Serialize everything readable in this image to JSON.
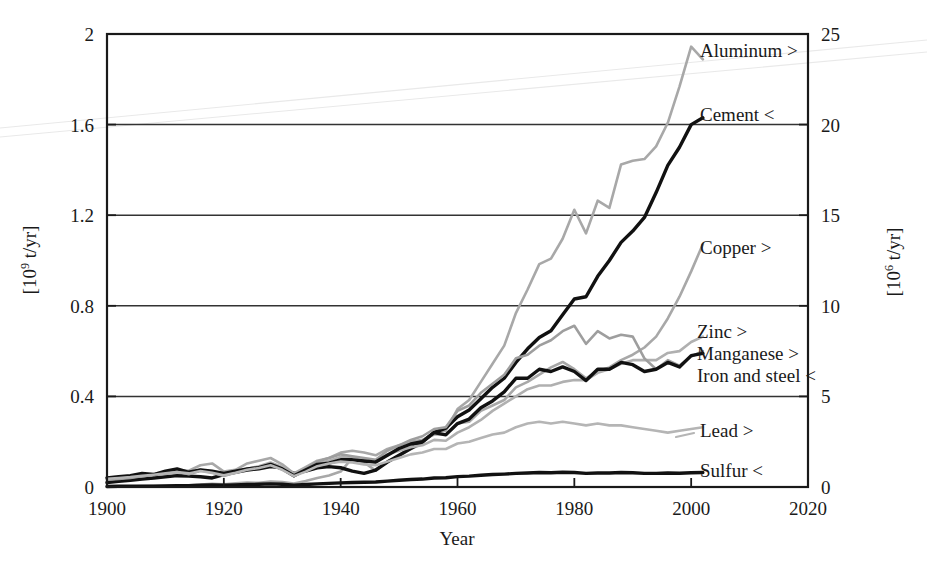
{
  "chart_data": {
    "type": "line",
    "title": "",
    "xlabel": "Year",
    "ylabel_left": "[10⁹ t/yr]",
    "ylabel_left_base": "[10",
    "ylabel_left_exp": "9",
    "ylabel_left_tail": " t/yr]",
    "ylabel_right": "[10⁶ t/yr]",
    "ylabel_right_base": "[10",
    "ylabel_right_exp": "6",
    "ylabel_right_tail": " t/yr]",
    "xlim": [
      1900,
      2020
    ],
    "ylim_left": [
      0,
      2
    ],
    "ylim_right": [
      0,
      25
    ],
    "xticks": [
      1900,
      1920,
      1940,
      1960,
      1980,
      2000,
      2020
    ],
    "xtick_labels": [
      "1900",
      "1920",
      "1940",
      "1960",
      "1980",
      "2000",
      "2020"
    ],
    "yticks_left": [
      0,
      0.4,
      0.8,
      1.2,
      1.6,
      2
    ],
    "ytick_labels_left": [
      "0",
      "0.4",
      "0.8",
      "1.2",
      "1.6",
      "2"
    ],
    "yticks_right": [
      0,
      5,
      10,
      15,
      20,
      25
    ],
    "ytick_labels_right": [
      "0",
      "5",
      "10",
      "15",
      "20",
      "25"
    ],
    "grid": true,
    "grid_axis": "y",
    "legend_position": "inline-right-annotations",
    "axis_note": "< = read on left axis (10^9 t/yr); > = read on right axis (10^6 t/yr)",
    "x": [
      1900,
      1902,
      1904,
      1906,
      1908,
      1910,
      1912,
      1914,
      1916,
      1918,
      1920,
      1922,
      1924,
      1926,
      1928,
      1930,
      1932,
      1934,
      1936,
      1938,
      1940,
      1942,
      1944,
      1946,
      1948,
      1950,
      1952,
      1954,
      1956,
      1958,
      1960,
      1962,
      1964,
      1966,
      1968,
      1970,
      1972,
      1974,
      1976,
      1978,
      1980,
      1982,
      1984,
      1986,
      1988,
      1990,
      1992,
      1994,
      1996,
      1998,
      2000,
      2002
    ],
    "series": [
      {
        "name": "Aluminum",
        "label": "Aluminum >",
        "axis": "right",
        "color": "#a8a8a8",
        "stroke_width": 2.6,
        "units": "10^6 t/yr",
        "values": [
          0.01,
          0.02,
          0.03,
          0.05,
          0.06,
          0.07,
          0.09,
          0.1,
          0.13,
          0.18,
          0.15,
          0.2,
          0.25,
          0.23,
          0.3,
          0.27,
          0.19,
          0.33,
          0.5,
          0.63,
          0.85,
          1.6,
          1.35,
          0.9,
          1.4,
          1.7,
          2.1,
          2.4,
          3.1,
          3.1,
          4.3,
          4.8,
          5.8,
          6.8,
          7.8,
          9.6,
          10.9,
          12.3,
          12.6,
          13.7,
          15.3,
          14.0,
          15.8,
          15.4,
          17.8,
          18.0,
          18.1,
          18.8,
          20.1,
          22.1,
          24.3,
          23.6
        ]
      },
      {
        "name": "Cement",
        "label": "Cement <",
        "axis": "left",
        "color": "#111111",
        "stroke_width": 3.4,
        "units": "10^9 t/yr",
        "values": [
          0.02,
          0.025,
          0.03,
          0.035,
          0.04,
          0.045,
          0.05,
          0.048,
          0.045,
          0.04,
          0.055,
          0.065,
          0.075,
          0.08,
          0.09,
          0.085,
          0.06,
          0.07,
          0.085,
          0.09,
          0.085,
          0.07,
          0.06,
          0.075,
          0.11,
          0.14,
          0.17,
          0.2,
          0.24,
          0.26,
          0.31,
          0.34,
          0.39,
          0.44,
          0.48,
          0.55,
          0.61,
          0.66,
          0.69,
          0.76,
          0.83,
          0.84,
          0.93,
          1.0,
          1.08,
          1.13,
          1.19,
          1.3,
          1.42,
          1.5,
          1.6,
          1.63
        ]
      },
      {
        "name": "Copper",
        "label": "Copper >",
        "axis": "right",
        "color": "#a8a8a8",
        "stroke_width": 2.6,
        "units": "10^6 t/yr",
        "values": [
          0.5,
          0.55,
          0.6,
          0.68,
          0.72,
          0.85,
          0.95,
          0.9,
          1.2,
          1.3,
          0.85,
          0.95,
          1.3,
          1.45,
          1.6,
          1.25,
          0.75,
          1.1,
          1.45,
          1.6,
          1.9,
          2.0,
          1.9,
          1.75,
          2.1,
          2.3,
          2.5,
          2.6,
          2.9,
          2.9,
          3.5,
          3.6,
          4.2,
          4.5,
          4.8,
          5.5,
          5.8,
          6.2,
          6.6,
          6.9,
          6.5,
          6.0,
          6.4,
          6.6,
          7.0,
          7.3,
          7.7,
          8.3,
          9.3,
          10.5,
          11.9,
          13.4
        ]
      },
      {
        "name": "Zinc",
        "label": "Zinc >",
        "axis": "right",
        "color": "#b0b0b0",
        "stroke_width": 2.6,
        "units": "10^6 t/yr",
        "values": [
          0.45,
          0.5,
          0.58,
          0.63,
          0.68,
          0.72,
          0.82,
          0.78,
          0.95,
          0.85,
          0.7,
          0.85,
          1.0,
          1.15,
          1.35,
          1.1,
          0.65,
          0.95,
          1.3,
          1.45,
          1.65,
          1.6,
          1.45,
          1.35,
          1.8,
          2.0,
          2.2,
          2.3,
          2.6,
          2.55,
          3.0,
          3.3,
          3.7,
          4.2,
          4.6,
          5.0,
          5.4,
          5.6,
          5.6,
          5.8,
          5.9,
          5.9,
          6.3,
          6.5,
          6.8,
          7.0,
          7.0,
          7.0,
          7.4,
          7.5,
          8.0,
          8.3
        ]
      },
      {
        "name": "Manganese",
        "label": "Manganese >",
        "axis": "right",
        "color": "#9e9e9e",
        "stroke_width": 2.6,
        "units": "10^6 t/yr",
        "values": [
          0.4,
          0.45,
          0.5,
          0.6,
          0.65,
          0.75,
          0.85,
          0.7,
          0.9,
          0.8,
          0.6,
          0.8,
          1.0,
          1.1,
          1.3,
          1.0,
          0.6,
          1.0,
          1.4,
          1.6,
          1.8,
          1.7,
          1.6,
          1.5,
          2.0,
          2.3,
          2.6,
          2.8,
          3.2,
          3.3,
          4.2,
          4.5,
          5.2,
          5.7,
          6.2,
          7.1,
          7.3,
          7.8,
          8.1,
          8.6,
          8.9,
          7.9,
          8.6,
          8.2,
          8.4,
          8.3,
          7.1,
          6.5,
          7.0,
          6.7,
          7.2,
          7.5
        ]
      },
      {
        "name": "Iron and steel",
        "label": "Iron and steel <",
        "axis": "left",
        "color": "#111111",
        "stroke_width": 3.4,
        "units": "10^9 t/yr",
        "values": [
          0.04,
          0.045,
          0.05,
          0.06,
          0.055,
          0.07,
          0.08,
          0.065,
          0.075,
          0.07,
          0.06,
          0.07,
          0.08,
          0.085,
          0.1,
          0.08,
          0.05,
          0.075,
          0.1,
          0.105,
          0.12,
          0.12,
          0.115,
          0.11,
          0.14,
          0.17,
          0.19,
          0.2,
          0.24,
          0.23,
          0.28,
          0.3,
          0.35,
          0.38,
          0.42,
          0.48,
          0.48,
          0.52,
          0.51,
          0.53,
          0.51,
          0.47,
          0.52,
          0.52,
          0.55,
          0.54,
          0.51,
          0.52,
          0.55,
          0.53,
          0.58,
          0.59
        ]
      },
      {
        "name": "Lead",
        "label": "Lead >",
        "axis": "right",
        "color": "#b5b5b5",
        "stroke_width": 2.6,
        "units": "10^6 t/yr",
        "values": [
          0.45,
          0.5,
          0.55,
          0.62,
          0.68,
          0.75,
          0.82,
          0.75,
          0.88,
          0.78,
          0.65,
          0.78,
          0.95,
          1.05,
          1.2,
          0.95,
          0.6,
          0.85,
          1.15,
          1.3,
          1.4,
          1.35,
          1.25,
          1.2,
          1.4,
          1.6,
          1.8,
          1.9,
          2.1,
          2.1,
          2.4,
          2.5,
          2.7,
          2.9,
          3.0,
          3.3,
          3.5,
          3.6,
          3.5,
          3.6,
          3.5,
          3.4,
          3.5,
          3.4,
          3.4,
          3.3,
          3.2,
          3.1,
          3.0,
          3.1,
          3.2,
          3.3
        ]
      },
      {
        "name": "Sulfur",
        "label": "Sulfur <",
        "axis": "left",
        "color": "#111111",
        "stroke_width": 3.4,
        "units": "10^9 t/yr",
        "values": [
          0.002,
          0.003,
          0.003,
          0.004,
          0.004,
          0.005,
          0.006,
          0.006,
          0.008,
          0.009,
          0.008,
          0.009,
          0.011,
          0.012,
          0.014,
          0.012,
          0.008,
          0.011,
          0.014,
          0.016,
          0.018,
          0.02,
          0.021,
          0.022,
          0.026,
          0.03,
          0.033,
          0.035,
          0.04,
          0.041,
          0.046,
          0.048,
          0.052,
          0.055,
          0.057,
          0.06,
          0.062,
          0.064,
          0.063,
          0.065,
          0.064,
          0.06,
          0.062,
          0.062,
          0.064,
          0.063,
          0.06,
          0.06,
          0.062,
          0.061,
          0.063,
          0.064
        ]
      }
    ],
    "annotations": [
      {
        "text": "Aluminum >",
        "x": 2002,
        "y_right": 24.3
      },
      {
        "text": "Cement <",
        "x": 2002,
        "y_left": 1.63
      },
      {
        "text": "Copper >",
        "x": 2002,
        "y_right": 13.4
      },
      {
        "text": "Zinc >",
        "x": 2002,
        "y_right": 8.3
      },
      {
        "text": "Manganese >",
        "x": 2002,
        "y_right": 7.5
      },
      {
        "text": "Iron and steel <",
        "x": 2002,
        "y_left": 0.59
      },
      {
        "text": "Lead >",
        "x": 2002,
        "y_right": 3.3
      },
      {
        "text": "Sulfur <",
        "x": 2002,
        "y_left": 0.064
      }
    ]
  },
  "labels": {
    "aluminum": "Aluminum >",
    "cement": "Cement <",
    "copper": "Copper >",
    "zinc": "Zinc >",
    "manganese": "Manganese >",
    "iron_and_steel": "Iron and steel <",
    "lead": "Lead >",
    "sulfur": "Sulfur <",
    "xaxis": "Year"
  },
  "yticks_left_labels": {
    "t0": "0",
    "t1": "0.4",
    "t2": "0.8",
    "t3": "1.2",
    "t4": "1.6",
    "t5": "2"
  },
  "yticks_right_labels": {
    "t0": "0",
    "t1": "5",
    "t2": "10",
    "t3": "15",
    "t4": "20",
    "t5": "25"
  },
  "xticks_labels": {
    "t0": "1900",
    "t1": "1920",
    "t2": "1940",
    "t3": "1960",
    "t4": "1980",
    "t5": "2000",
    "t6": "2020"
  },
  "axis_units": {
    "left_base": "[10",
    "left_exp": "9",
    "left_tail": " t/yr]",
    "right_base": "[10",
    "right_exp": "6",
    "right_tail": " t/yr]"
  },
  "colors": {
    "gray_series": "#a8a8a8",
    "black_series": "#111111",
    "axis": "#1a1a1a",
    "grid": "#333333",
    "background": "#ffffff"
  }
}
